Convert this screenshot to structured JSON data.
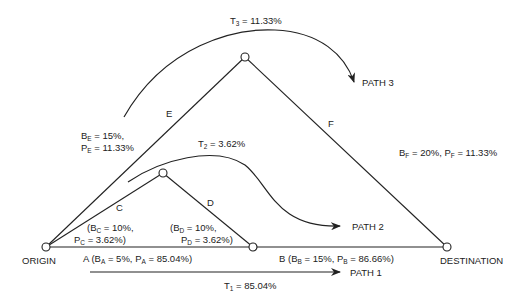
{
  "nodes": {
    "origin": {
      "label": "ORIGIN"
    },
    "destination": {
      "label": "DESTINATION"
    }
  },
  "edges": {
    "A": {
      "name": "A",
      "prefix": "A (B",
      "sub_b": "A",
      "b_val": " = 5%, P",
      "sub_p": "A",
      "p_val": " = 85.04%)"
    },
    "B": {
      "name": "B",
      "prefix": "B (B",
      "sub_b": "B",
      "b_val": " = 15%, P",
      "sub_p": "B",
      "p_val": " = 86.66%)"
    },
    "C": {
      "name": "C",
      "line1_pre": "(B",
      "sub_b": "C",
      "line1_post": " = 10%,",
      "line2_pre": "P",
      "sub_p": "C",
      "line2_post": " = 3.62%)"
    },
    "D": {
      "name": "D",
      "line1_pre": "(B",
      "sub_b": "D",
      "line1_post": " = 10%,",
      "line2_pre": "P",
      "sub_p": "D",
      "line2_post": " = 3.62%)"
    },
    "E": {
      "name": "E",
      "line1_pre": "B",
      "sub_b": "E",
      "line1_post": " = 15%,",
      "line2_pre": "P",
      "sub_p": "E",
      "line2_post": " = 11.33%"
    },
    "F": {
      "name": "F",
      "b_pre": "B",
      "sub_b": "F",
      "b_post": " = 20%, P",
      "sub_p": "F",
      "p_post": " = 11.33%"
    }
  },
  "paths": [
    {
      "label": "PATH 1",
      "t_pre": "T",
      "t_sub": "1",
      "t_val": " = 85.04%"
    },
    {
      "label": "PATH 2",
      "t_pre": "T",
      "t_sub": "2",
      "t_val": " = 3.62%"
    },
    {
      "label": "PATH 3",
      "t_pre": "T",
      "t_sub": "3",
      "t_val": " = 11.33%"
    }
  ],
  "colors": {
    "ink": "#222222",
    "background": "#ffffff"
  }
}
